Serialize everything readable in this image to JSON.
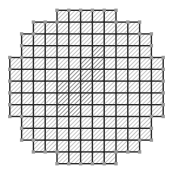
{
  "figure": {
    "type": "diagram",
    "width": 173,
    "height": 174,
    "background_color": "#ffffff"
  },
  "geometry": {
    "center_x": 86.5,
    "center_y": 87.0,
    "radius_cells": 6.2,
    "cell_size": 11.8,
    "grid_columns": 13,
    "grid_rows": 13,
    "origin_x": 9.8,
    "origin_y": 10.3
  },
  "style": {
    "grid_line_color": "#2b2b2b",
    "grid_line_width": 1.4,
    "hatch_color_light": "#b9b9b9",
    "hatch_color_dark": "#8a8a8a",
    "hatch_angle_deg": 45,
    "hatch_spacing": 3.0,
    "hatch_stroke_width": 1.6,
    "cell_fill_color": "#ffffff",
    "node_color": "#9a9a9a",
    "node_size": 3.4
  },
  "cells": {
    "note": "Occupancy mask per row: 1 = cell present inside disc, 0 = outside disc",
    "mask": [
      [
        0,
        0,
        0,
        0,
        1,
        1,
        1,
        1,
        1,
        0,
        0,
        0,
        0
      ],
      [
        0,
        0,
        1,
        1,
        1,
        1,
        1,
        1,
        1,
        1,
        1,
        0,
        0
      ],
      [
        0,
        1,
        1,
        1,
        1,
        1,
        1,
        1,
        1,
        1,
        1,
        1,
        0
      ],
      [
        0,
        1,
        1,
        1,
        1,
        1,
        1,
        1,
        1,
        1,
        1,
        1,
        0
      ],
      [
        1,
        1,
        1,
        1,
        1,
        1,
        1,
        1,
        1,
        1,
        1,
        1,
        1
      ],
      [
        1,
        1,
        1,
        1,
        1,
        1,
        1,
        1,
        1,
        1,
        1,
        1,
        1
      ],
      [
        1,
        1,
        1,
        1,
        1,
        1,
        1,
        1,
        1,
        1,
        1,
        1,
        1
      ],
      [
        1,
        1,
        1,
        1,
        1,
        1,
        1,
        1,
        1,
        1,
        1,
        1,
        1
      ],
      [
        1,
        1,
        1,
        1,
        1,
        1,
        1,
        1,
        1,
        1,
        1,
        1,
        1
      ],
      [
        0,
        1,
        1,
        1,
        1,
        1,
        1,
        1,
        1,
        1,
        1,
        1,
        0
      ],
      [
        0,
        1,
        1,
        1,
        1,
        1,
        1,
        1,
        1,
        1,
        1,
        1,
        0
      ],
      [
        0,
        0,
        1,
        1,
        1,
        1,
        1,
        1,
        1,
        1,
        1,
        0,
        0
      ],
      [
        0,
        0,
        0,
        0,
        1,
        1,
        1,
        1,
        1,
        0,
        0,
        0,
        0
      ]
    ],
    "dark_mask": {
      "note": "1 = cell rendered with darker hatch (central diagonal band)",
      "rows": [
        [
          0,
          0,
          0,
          0,
          0,
          0,
          0,
          0,
          0,
          0,
          0,
          0,
          0
        ],
        [
          0,
          0,
          0,
          0,
          0,
          0,
          0,
          0,
          0,
          0,
          0,
          0,
          0
        ],
        [
          0,
          0,
          0,
          0,
          0,
          0,
          0,
          0,
          0,
          0,
          0,
          0,
          0
        ],
        [
          0,
          0,
          0,
          0,
          0,
          0,
          0,
          1,
          0,
          0,
          0,
          0,
          0
        ],
        [
          0,
          0,
          0,
          0,
          0,
          0,
          1,
          1,
          0,
          0,
          0,
          0,
          0
        ],
        [
          0,
          0,
          0,
          0,
          0,
          1,
          1,
          1,
          0,
          0,
          0,
          0,
          0
        ],
        [
          0,
          0,
          0,
          0,
          1,
          1,
          1,
          0,
          0,
          0,
          0,
          0,
          0
        ],
        [
          0,
          0,
          0,
          0,
          1,
          1,
          1,
          0,
          0,
          0,
          0,
          0,
          0
        ],
        [
          0,
          0,
          0,
          0,
          1,
          1,
          0,
          0,
          0,
          0,
          0,
          0,
          0
        ],
        [
          0,
          0,
          0,
          0,
          0,
          0,
          0,
          0,
          0,
          0,
          0,
          0,
          0
        ],
        [
          0,
          0,
          0,
          0,
          0,
          0,
          0,
          0,
          0,
          0,
          0,
          0,
          0
        ],
        [
          0,
          0,
          0,
          0,
          0,
          0,
          0,
          0,
          0,
          0,
          0,
          0,
          0
        ],
        [
          0,
          0,
          0,
          0,
          0,
          0,
          0,
          0,
          0,
          0,
          0,
          0,
          0
        ]
      ]
    }
  }
}
